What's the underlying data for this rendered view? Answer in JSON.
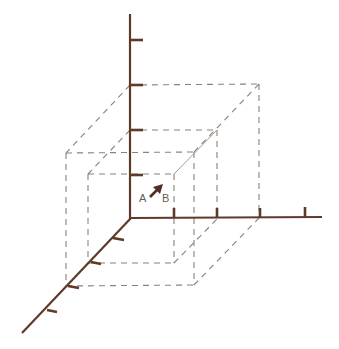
{
  "diagram": {
    "type": "3d-coordinate-axes-with-nested-boxes",
    "colors": {
      "axis": "#5e3b28",
      "dashed": "#8c8079",
      "background": "#ffffff"
    },
    "labels": {
      "point_a": "A",
      "point_b": "B"
    },
    "axes": {
      "vertical_ticks": 4,
      "horizontal_ticks": 4,
      "depth_ticks": 4
    },
    "boxes": [
      {
        "name": "inner-box",
        "size": [
          1,
          1,
          1
        ]
      },
      {
        "name": "outer-box",
        "size": [
          3,
          2,
          3
        ]
      }
    ],
    "arrow": {
      "from": "A",
      "to": "B"
    }
  }
}
